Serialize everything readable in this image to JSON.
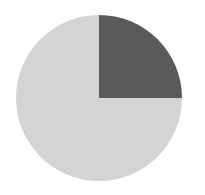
{
  "chart_data": {
    "type": "pie",
    "title": "",
    "labels": [
      "Slice A",
      "Slice B"
    ],
    "values": [
      25,
      75
    ],
    "colors": [
      "#5a5a5a",
      "#d4d4d4"
    ],
    "start_angle_deg": 90,
    "direction": "clockwise",
    "legend": "none",
    "data_labels": "none",
    "geometry": {
      "cx": 99,
      "cy": 98,
      "r": 83
    }
  },
  "colors": {
    "background": "#ffffff",
    "dark_slice": "#5a5a5a",
    "light_slice": "#d4d4d4"
  }
}
